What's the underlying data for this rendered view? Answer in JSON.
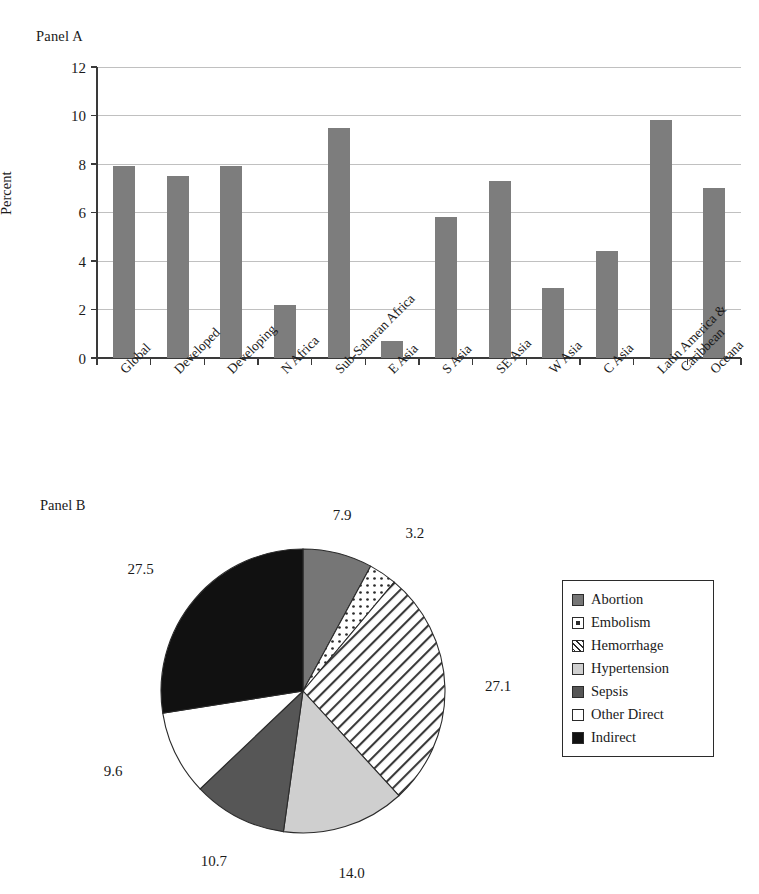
{
  "figure": {
    "panel_a_label": "Panel A",
    "panel_b_label": "Panel B",
    "caption": ""
  },
  "chart_data": [
    {
      "type": "bar",
      "panel": "Panel A",
      "title": "",
      "xlabel": "",
      "ylabel": "Percent",
      "ylim": [
        0,
        12
      ],
      "yticks": [
        0,
        2,
        4,
        6,
        8,
        10,
        12
      ],
      "ytick_labels": [
        "0",
        "2",
        "4",
        "6",
        "8",
        "10",
        "12"
      ],
      "grid": true,
      "bar_color": "#7d7d7d",
      "categories": [
        "Global",
        "Developed",
        "Developing",
        "N Africa",
        "Sub-Saharan Africa",
        "E Asia",
        "S Asia",
        "SE Asia",
        "W Asia",
        "C Asia",
        "Latin America &\nCaribbean",
        "Oceana"
      ],
      "values": [
        7.9,
        7.5,
        7.9,
        2.2,
        9.5,
        0.7,
        5.8,
        7.3,
        2.9,
        4.4,
        9.8,
        7.0
      ]
    },
    {
      "type": "pie",
      "panel": "Panel B",
      "title": "",
      "legend_position": "right",
      "labels": [
        "Abortion",
        "Embolism",
        "Hemorrhage",
        "Hypertension",
        "Sepsis",
        "Other Direct",
        "Indirect"
      ],
      "values": [
        7.9,
        3.2,
        27.1,
        14.0,
        10.7,
        9.6,
        27.5
      ],
      "value_labels": [
        "7.9",
        "3.2",
        "27.1",
        "14.0",
        "10.7",
        "9.6",
        "27.5"
      ],
      "slice_styles": [
        "solid-medium-gray",
        "white-dotted",
        "white-diagonal-hatch",
        "solid-light-gray",
        "solid-dark-gray",
        "solid-white",
        "solid-black"
      ],
      "slice_colors": [
        "#767676",
        "#ffffff",
        "#ffffff",
        "#cfcfcf",
        "#565656",
        "#ffffff",
        "#111111"
      ]
    }
  ]
}
